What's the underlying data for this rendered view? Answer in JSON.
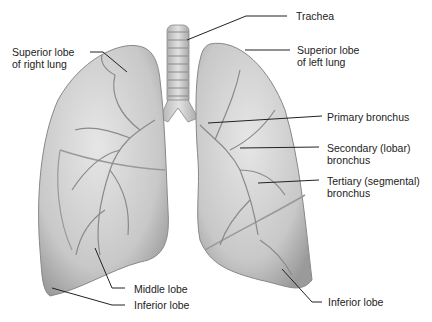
{
  "diagram": {
    "labels": {
      "trachea": "Trachea",
      "superior_right_1": "Superior lobe",
      "superior_right_2": "of right lung",
      "superior_left_1": "Superior lobe",
      "superior_left_2": "of left lung",
      "primary_bronchus": "Primary bronchus",
      "secondary_1": "Secondary (lobar)",
      "secondary_2": "bronchus",
      "tertiary_1": "Tertiary (segmental)",
      "tertiary_2": "bronchus",
      "middle_lobe": "Middle lobe",
      "inferior_right": "Inferior lobe",
      "inferior_left": "Inferior lobe"
    },
    "colors": {
      "lung_fill": "#d2d2d2",
      "lung_shade": "#a8a8a8",
      "vessel": "#8a8a8a",
      "leader_line": "#222222",
      "text": "#222222"
    }
  }
}
